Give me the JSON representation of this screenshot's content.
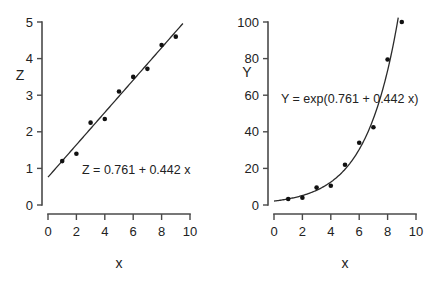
{
  "figure": {
    "background": "#ffffff",
    "marker_color": "#111111",
    "line_color": "#2b2b2b",
    "axis_color": "#4a4a4a"
  },
  "chart_data": [
    {
      "type": "scatter",
      "panel": "left",
      "title": "",
      "xlabel": "x",
      "ylabel": "Z",
      "xlim": [
        0,
        10
      ],
      "ylim": [
        0,
        5
      ],
      "xticks": [
        0,
        2,
        4,
        6,
        8,
        10
      ],
      "yticks": [
        0,
        1,
        2,
        3,
        4,
        5
      ],
      "xticklabels": [
        "0",
        "2",
        "4",
        "6",
        "8",
        "10"
      ],
      "yticklabels": [
        "0",
        "1",
        "2",
        "3",
        "4",
        "5"
      ],
      "grid": false,
      "legend": "none",
      "annotation": "Z = 0.761 + 0.442 x",
      "fit": {
        "kind": "linear",
        "intercept": 0.761,
        "slope": 0.442,
        "x_start": 0,
        "x_end": 9.5
      },
      "x": [
        1,
        2,
        3,
        4,
        5,
        6,
        7,
        8,
        9
      ],
      "values": [
        1.2,
        1.4,
        2.25,
        2.35,
        3.1,
        3.5,
        3.72,
        4.37,
        4.6
      ]
    },
    {
      "type": "scatter",
      "panel": "right",
      "title": "",
      "xlabel": "x",
      "ylabel": "Y",
      "xlim": [
        0,
        10
      ],
      "ylim": [
        0,
        100
      ],
      "xticks": [
        0,
        2,
        4,
        6,
        8,
        10
      ],
      "yticks": [
        0,
        20,
        40,
        60,
        80,
        100
      ],
      "xticklabels": [
        "0",
        "2",
        "4",
        "6",
        "8",
        "10"
      ],
      "yticklabels": [
        "0",
        "20",
        "40",
        "60",
        "80",
        "100"
      ],
      "grid": false,
      "legend": "none",
      "annotation": "Y = exp(0.761 + 0.442 x)",
      "fit": {
        "kind": "exponential",
        "intercept": 0.761,
        "slope": 0.442,
        "x_start": 0,
        "x_end": 8.75
      },
      "x": [
        1,
        2,
        3,
        4,
        5,
        6,
        7,
        8,
        9
      ],
      "values": [
        3.3,
        4.0,
        9.5,
        10.5,
        22.0,
        34.0,
        42.5,
        79.5,
        100.0
      ]
    }
  ]
}
